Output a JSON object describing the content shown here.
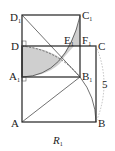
{
  "figure": {
    "caption": "R1",
    "side_length_label": "5",
    "points": {
      "A": "A",
      "B": "B",
      "C": "C",
      "D": "D",
      "A1": "A1",
      "B1": "B1",
      "C1": "C1",
      "D1": "D1",
      "E1": "E1",
      "F1": "F1"
    },
    "colors": {
      "stroke": "#222222",
      "shade": "#cfcfcf",
      "dashed": "#999999"
    }
  }
}
